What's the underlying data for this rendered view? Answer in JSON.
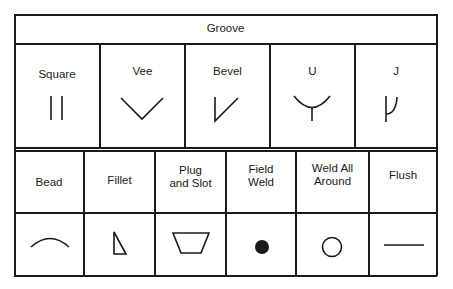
{
  "groove": {
    "header": "Groove",
    "types": [
      {
        "label": "Square",
        "symbol": "square-groove-icon"
      },
      {
        "label": "Vee",
        "symbol": "vee-groove-icon"
      },
      {
        "label": "Bevel",
        "symbol": "bevel-groove-icon"
      },
      {
        "label": "U",
        "symbol": "u-groove-icon"
      },
      {
        "label": "J",
        "symbol": "j-groove-icon"
      }
    ]
  },
  "other": {
    "types": [
      {
        "label": "Bead",
        "symbol": "bead-icon"
      },
      {
        "label": "Fillet",
        "symbol": "fillet-icon"
      },
      {
        "label": "Plug\nand Slot",
        "symbol": "plug-and-slot-icon"
      },
      {
        "label": "Field\nWeld",
        "symbol": "field-weld-icon"
      },
      {
        "label": "Weld All\nAround",
        "symbol": "weld-all-around-icon"
      },
      {
        "label": "Flush",
        "symbol": "flush-icon"
      }
    ]
  },
  "colors": {
    "line": "#1a1a1a",
    "background": "#ffffff"
  }
}
